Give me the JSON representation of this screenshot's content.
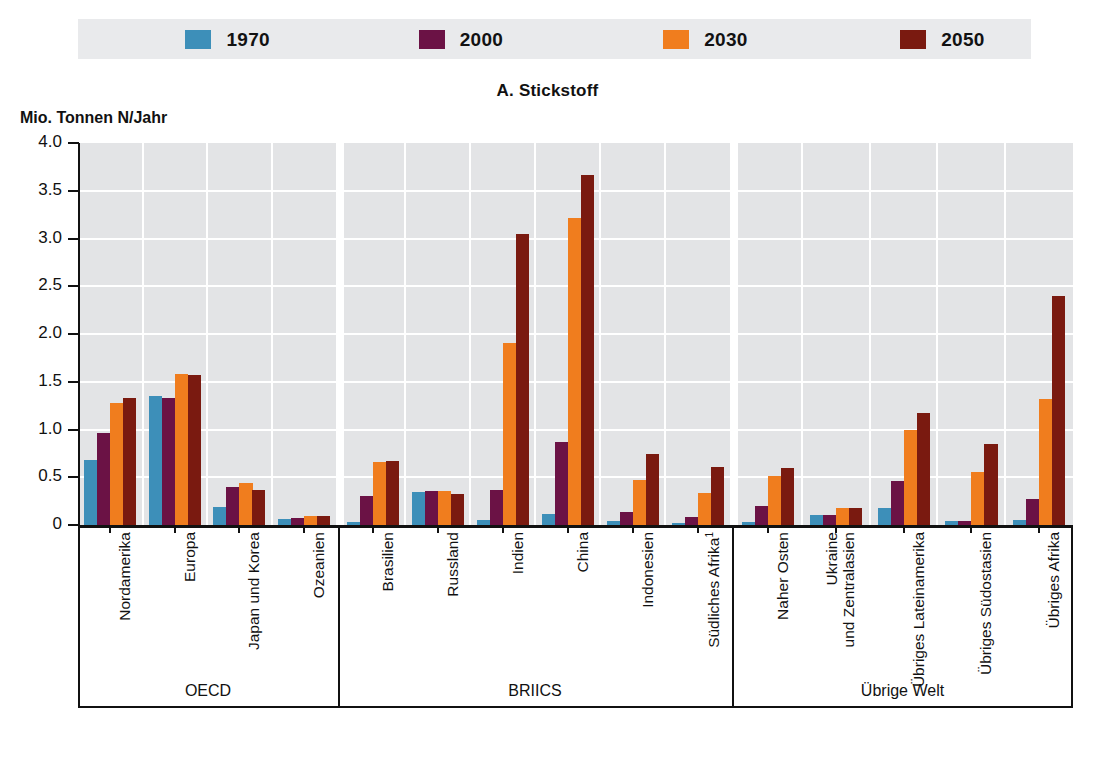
{
  "chart_title": "A. Stickstoff",
  "yaxis_title": "Mio. Tonnen N/Jahr",
  "legend": {
    "items": [
      {
        "label": "1970",
        "color": "#3d8fb9"
      },
      {
        "label": "2000",
        "color": "#6b1245"
      },
      {
        "label": "2030",
        "color": "#f07d1e"
      },
      {
        "label": "2050",
        "color": "#7a1a10"
      }
    ]
  },
  "groups": [
    {
      "label": "OECD",
      "count": 4
    },
    {
      "label": "BRIICS",
      "count": 6
    },
    {
      "label": "Übrige Welt",
      "count": 5
    }
  ],
  "chart_data": {
    "type": "bar",
    "title": "A. Stickstoff",
    "xlabel": "",
    "ylabel": "Mio. Tonnen N/Jahr",
    "ylim": [
      0,
      4.0
    ],
    "yticks": [
      "0",
      "0.5",
      "1.0",
      "1.5",
      "2.0",
      "2.5",
      "3.0",
      "3.5",
      "4.0"
    ],
    "ytick_values": [
      0,
      0.5,
      1.0,
      1.5,
      2.0,
      2.5,
      3.0,
      3.5,
      4.0
    ],
    "grid": true,
    "legend_position": "top",
    "categories": [
      "Nordamerika",
      "Europa",
      "Japan und Korea",
      "Ozeanien",
      "Brasilien",
      "Russland",
      "Indien",
      "China",
      "Indonesien",
      "Südliches Afrika¹",
      "Naher Osten",
      "Ukraine und Zentralasien",
      "Übriges Lateinamerika",
      "Übriges Südostasien",
      "Übriges Afrika"
    ],
    "category_lines": [
      [
        "Nordamerika"
      ],
      [
        "Europa"
      ],
      [
        "Japan und Korea"
      ],
      [
        "Ozeanien"
      ],
      [
        "Brasilien"
      ],
      [
        "Russland"
      ],
      [
        "Indien"
      ],
      [
        "China"
      ],
      [
        "Indonesien"
      ],
      [
        "Südliches Afrika¹"
      ],
      [
        "Naher Osten"
      ],
      [
        "Ukraine",
        "und Zentralasien"
      ],
      [
        "Übriges Lateinamerika"
      ],
      [
        "Übriges Südostasien"
      ],
      [
        "Übriges Afrika"
      ]
    ],
    "series": [
      {
        "name": "1970",
        "color": "#3d8fb9",
        "values": [
          0.68,
          1.35,
          0.19,
          0.06,
          0.03,
          0.35,
          0.05,
          0.12,
          0.04,
          0.02,
          0.03,
          0.1,
          0.18,
          0.04,
          0.05
        ]
      },
      {
        "name": "2000",
        "color": "#6b1245",
        "values": [
          0.96,
          1.33,
          0.4,
          0.07,
          0.3,
          0.36,
          0.37,
          0.87,
          0.14,
          0.08,
          0.2,
          0.11,
          0.46,
          0.04,
          0.27
        ]
      },
      {
        "name": "2030",
        "color": "#f07d1e",
        "values": [
          1.28,
          1.58,
          0.44,
          0.09,
          0.66,
          0.36,
          1.91,
          3.22,
          0.47,
          0.34,
          0.51,
          0.18,
          1.0,
          0.55,
          1.32
        ]
      },
      {
        "name": "2050",
        "color": "#7a1a10",
        "values": [
          1.33,
          1.57,
          0.37,
          0.09,
          0.67,
          0.32,
          3.05,
          3.67,
          0.74,
          0.61,
          0.6,
          0.18,
          1.17,
          0.85,
          2.4
        ]
      }
    ]
  }
}
